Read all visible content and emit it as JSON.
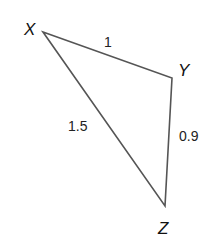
{
  "diagram": {
    "type": "triangle",
    "line_color": "#555555",
    "vertices": [
      {
        "name": "X",
        "x": 43,
        "y": 32,
        "label_x": 24,
        "label_y": 35
      },
      {
        "name": "Y",
        "x": 172,
        "y": 78,
        "label_x": 178,
        "label_y": 76
      },
      {
        "name": "Z",
        "x": 165,
        "y": 206,
        "label_x": 158,
        "label_y": 234
      }
    ],
    "sides": [
      {
        "from": "X",
        "to": "Y",
        "length": "1",
        "label_x": 104,
        "label_y": 47
      },
      {
        "from": "X",
        "to": "Z",
        "length": "1.5",
        "label_x": 68,
        "label_y": 131
      },
      {
        "from": "Y",
        "to": "Z",
        "length": "0.9",
        "label_x": 179,
        "label_y": 141
      }
    ]
  }
}
